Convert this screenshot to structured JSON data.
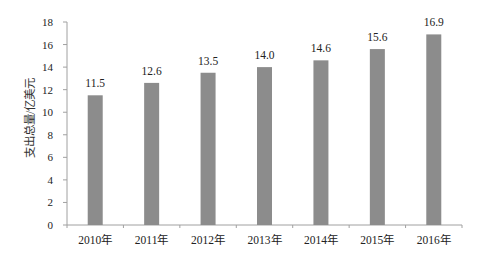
{
  "chart_data": {
    "type": "bar",
    "title": "",
    "xlabel": "",
    "ylabel": "支出总量/亿美元",
    "categories": [
      "2010年",
      "2011年",
      "2012年",
      "2013年",
      "2014年",
      "2015年",
      "2016年"
    ],
    "values": [
      11.5,
      12.6,
      13.5,
      14.0,
      14.6,
      15.6,
      16.9
    ],
    "value_labels": [
      "11.5",
      "12.6",
      "13.5",
      "14.0",
      "14.6",
      "15.6",
      "16.9"
    ],
    "ylim": [
      0,
      18
    ],
    "yticks": [
      0,
      2,
      4,
      6,
      8,
      10,
      12,
      14,
      16,
      18
    ],
    "grid": false,
    "legend": null,
    "bar_color": "#8c8c8c",
    "axis_color": "#a0a0a0"
  }
}
